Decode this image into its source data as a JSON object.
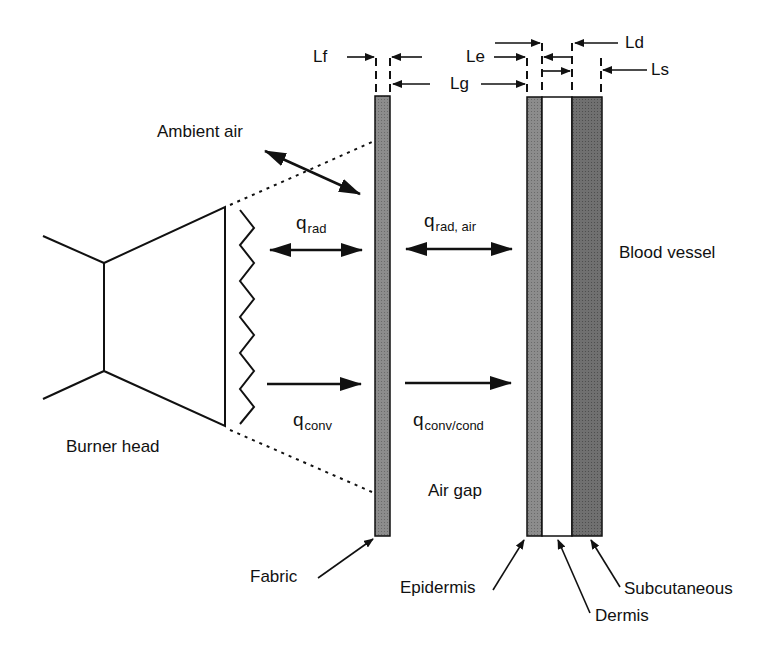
{
  "dimension_labels": {
    "fabric_thickness": "Lf",
    "air_gap_thickness": "Lg",
    "epidermis_thickness": "Le",
    "dermis_thickness": "Ld",
    "subcutaneous_thickness": "Ls"
  },
  "regions": {
    "ambient_air": "Ambient air",
    "burner_head": "Burner head",
    "fabric": "Fabric",
    "air_gap": "Air gap",
    "blood_vessel": "Blood vessel",
    "epidermis": "Epidermis",
    "dermis": "Dermis",
    "subcutaneous": "Subcutaneous"
  },
  "heat_fluxes": {
    "q_rad": {
      "symbol": "q",
      "subscript": "rad"
    },
    "q_conv": {
      "symbol": "q",
      "subscript": "conv"
    },
    "q_rad_air": {
      "symbol": "q",
      "subscript": "rad, air"
    },
    "q_conv_cond": {
      "symbol": "q",
      "subscript": "conv/cond"
    }
  },
  "colors": {
    "line": "#111111",
    "fabric_fill": "#8a8a8a",
    "epidermis_fill": "#8a8a8a",
    "dermis_fill": "#ffffff",
    "subcutaneous_fill": "#6e6e6e"
  }
}
